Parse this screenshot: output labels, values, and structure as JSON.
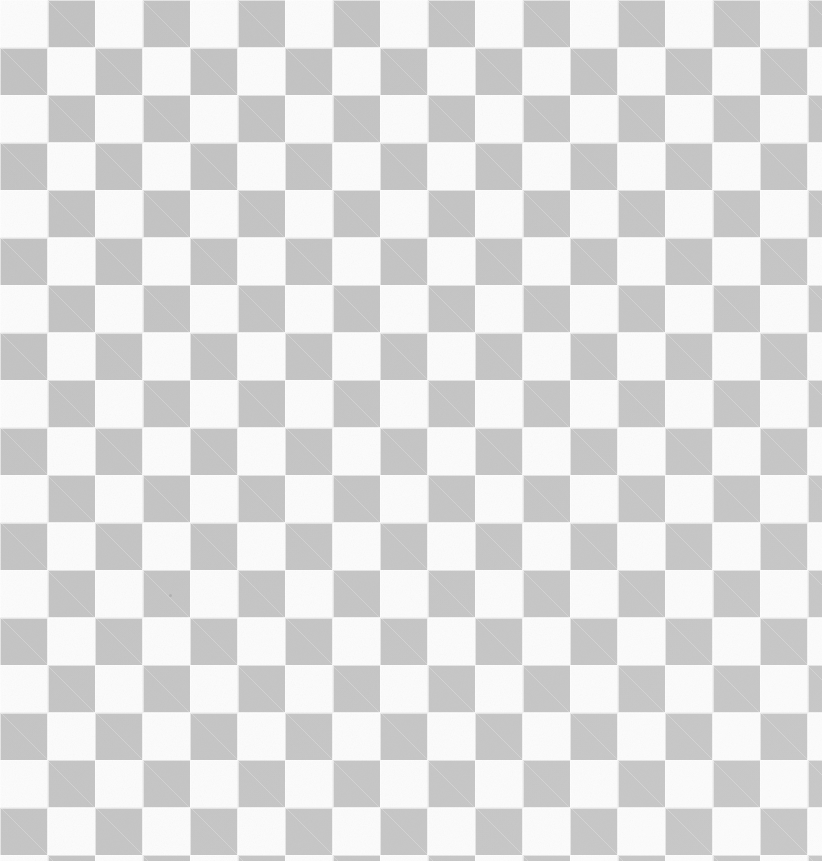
{
  "pattern": {
    "name": "transparency-checkerboard",
    "type": "checkerboard",
    "cell_size_px": 47.5,
    "columns": 18,
    "rows": 19,
    "origin_cell_color": "dark",
    "colors": {
      "dark": "#c2c2c2",
      "light": "#fbfbfb",
      "seam": "#ffffff",
      "page_background": "#ffffff"
    },
    "seam_width_px": 1.5,
    "texture": {
      "grain": "scan-noise",
      "grain_opacity": 0.5
    }
  },
  "canvas": {
    "width_px": 822,
    "height_px": 861
  },
  "artifacts": [
    {
      "name": "dust-speck",
      "x_px": 169,
      "y_px": 594
    }
  ]
}
